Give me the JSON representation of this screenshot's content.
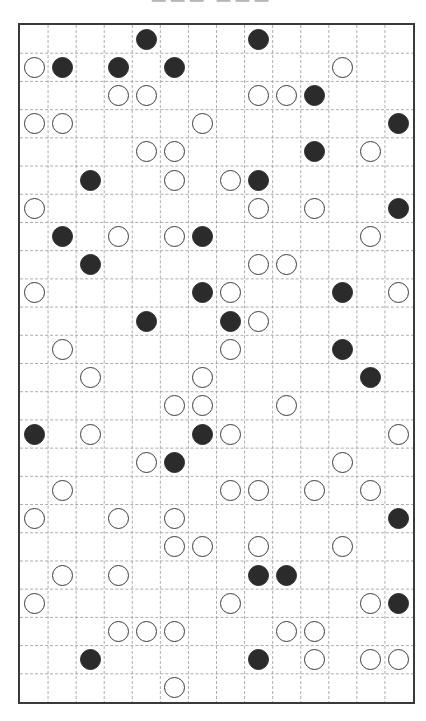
{
  "puzzle": {
    "type": "masyu",
    "cols": 14,
    "rows": 24,
    "colors": {
      "border": "#3a3a3a",
      "grid_dash": "#9a9a9a",
      "black_stone": "#2b2b2b",
      "white_stone_edge": "#3c3c3c"
    },
    "stones": [
      {
        "r": 0,
        "c": 4,
        "t": "black"
      },
      {
        "r": 0,
        "c": 8,
        "t": "black"
      },
      {
        "r": 1,
        "c": 0,
        "t": "white"
      },
      {
        "r": 1,
        "c": 1,
        "t": "black"
      },
      {
        "r": 1,
        "c": 3,
        "t": "black"
      },
      {
        "r": 1,
        "c": 5,
        "t": "black"
      },
      {
        "r": 1,
        "c": 11,
        "t": "white"
      },
      {
        "r": 2,
        "c": 3,
        "t": "white"
      },
      {
        "r": 2,
        "c": 4,
        "t": "white"
      },
      {
        "r": 2,
        "c": 8,
        "t": "white"
      },
      {
        "r": 2,
        "c": 9,
        "t": "white"
      },
      {
        "r": 2,
        "c": 10,
        "t": "black"
      },
      {
        "r": 3,
        "c": 0,
        "t": "white"
      },
      {
        "r": 3,
        "c": 1,
        "t": "white"
      },
      {
        "r": 3,
        "c": 6,
        "t": "white"
      },
      {
        "r": 3,
        "c": 13,
        "t": "black"
      },
      {
        "r": 4,
        "c": 4,
        "t": "white"
      },
      {
        "r": 4,
        "c": 5,
        "t": "white"
      },
      {
        "r": 4,
        "c": 10,
        "t": "black"
      },
      {
        "r": 4,
        "c": 12,
        "t": "white"
      },
      {
        "r": 5,
        "c": 2,
        "t": "black"
      },
      {
        "r": 5,
        "c": 5,
        "t": "white"
      },
      {
        "r": 5,
        "c": 7,
        "t": "white"
      },
      {
        "r": 5,
        "c": 8,
        "t": "black"
      },
      {
        "r": 6,
        "c": 0,
        "t": "white"
      },
      {
        "r": 6,
        "c": 8,
        "t": "white"
      },
      {
        "r": 6,
        "c": 10,
        "t": "white"
      },
      {
        "r": 6,
        "c": 13,
        "t": "black"
      },
      {
        "r": 7,
        "c": 1,
        "t": "black"
      },
      {
        "r": 7,
        "c": 3,
        "t": "white"
      },
      {
        "r": 7,
        "c": 5,
        "t": "white"
      },
      {
        "r": 7,
        "c": 6,
        "t": "black"
      },
      {
        "r": 7,
        "c": 12,
        "t": "white"
      },
      {
        "r": 8,
        "c": 2,
        "t": "black"
      },
      {
        "r": 8,
        "c": 8,
        "t": "white"
      },
      {
        "r": 8,
        "c": 9,
        "t": "white"
      },
      {
        "r": 9,
        "c": 0,
        "t": "white"
      },
      {
        "r": 9,
        "c": 6,
        "t": "black"
      },
      {
        "r": 9,
        "c": 7,
        "t": "white"
      },
      {
        "r": 9,
        "c": 11,
        "t": "black"
      },
      {
        "r": 9,
        "c": 13,
        "t": "white"
      },
      {
        "r": 10,
        "c": 4,
        "t": "black"
      },
      {
        "r": 10,
        "c": 7,
        "t": "black"
      },
      {
        "r": 10,
        "c": 8,
        "t": "white"
      },
      {
        "r": 11,
        "c": 1,
        "t": "white"
      },
      {
        "r": 11,
        "c": 7,
        "t": "white"
      },
      {
        "r": 11,
        "c": 11,
        "t": "black"
      },
      {
        "r": 12,
        "c": 2,
        "t": "white"
      },
      {
        "r": 12,
        "c": 6,
        "t": "white"
      },
      {
        "r": 12,
        "c": 12,
        "t": "black"
      },
      {
        "r": 13,
        "c": 5,
        "t": "white"
      },
      {
        "r": 13,
        "c": 6,
        "t": "white"
      },
      {
        "r": 13,
        "c": 9,
        "t": "white"
      },
      {
        "r": 14,
        "c": 0,
        "t": "black"
      },
      {
        "r": 14,
        "c": 2,
        "t": "white"
      },
      {
        "r": 14,
        "c": 6,
        "t": "black"
      },
      {
        "r": 14,
        "c": 7,
        "t": "white"
      },
      {
        "r": 14,
        "c": 13,
        "t": "white"
      },
      {
        "r": 15,
        "c": 4,
        "t": "white"
      },
      {
        "r": 15,
        "c": 5,
        "t": "black"
      },
      {
        "r": 15,
        "c": 11,
        "t": "white"
      },
      {
        "r": 16,
        "c": 1,
        "t": "white"
      },
      {
        "r": 16,
        "c": 7,
        "t": "white"
      },
      {
        "r": 16,
        "c": 8,
        "t": "white"
      },
      {
        "r": 16,
        "c": 10,
        "t": "white"
      },
      {
        "r": 16,
        "c": 12,
        "t": "white"
      },
      {
        "r": 17,
        "c": 0,
        "t": "white"
      },
      {
        "r": 17,
        "c": 3,
        "t": "white"
      },
      {
        "r": 17,
        "c": 5,
        "t": "white"
      },
      {
        "r": 17,
        "c": 13,
        "t": "black"
      },
      {
        "r": 18,
        "c": 5,
        "t": "white"
      },
      {
        "r": 18,
        "c": 6,
        "t": "white"
      },
      {
        "r": 18,
        "c": 8,
        "t": "white"
      },
      {
        "r": 18,
        "c": 11,
        "t": "white"
      },
      {
        "r": 19,
        "c": 1,
        "t": "white"
      },
      {
        "r": 19,
        "c": 3,
        "t": "white"
      },
      {
        "r": 19,
        "c": 8,
        "t": "black"
      },
      {
        "r": 19,
        "c": 9,
        "t": "black"
      },
      {
        "r": 20,
        "c": 0,
        "t": "white"
      },
      {
        "r": 20,
        "c": 7,
        "t": "white"
      },
      {
        "r": 20,
        "c": 12,
        "t": "white"
      },
      {
        "r": 20,
        "c": 13,
        "t": "black"
      },
      {
        "r": 21,
        "c": 3,
        "t": "white"
      },
      {
        "r": 21,
        "c": 4,
        "t": "white"
      },
      {
        "r": 21,
        "c": 5,
        "t": "white"
      },
      {
        "r": 21,
        "c": 9,
        "t": "white"
      },
      {
        "r": 21,
        "c": 10,
        "t": "white"
      },
      {
        "r": 22,
        "c": 2,
        "t": "black"
      },
      {
        "r": 22,
        "c": 8,
        "t": "black"
      },
      {
        "r": 22,
        "c": 10,
        "t": "white"
      },
      {
        "r": 22,
        "c": 12,
        "t": "white"
      },
      {
        "r": 22,
        "c": 13,
        "t": "white"
      },
      {
        "r": 23,
        "c": 5,
        "t": "white"
      }
    ]
  }
}
